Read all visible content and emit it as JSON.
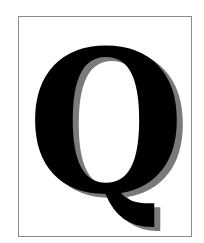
{
  "figure": {
    "letter": "Q",
    "colors": {
      "letter": "#000000",
      "shadow": "#7a7a7a",
      "border": "#8a8a8a",
      "background": "#ffffff"
    }
  }
}
